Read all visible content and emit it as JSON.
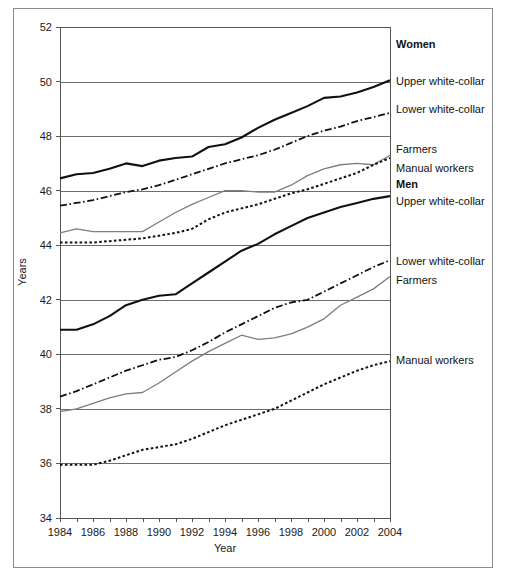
{
  "figure": {
    "border_color": "#8b8b8b",
    "background": "#ffffff"
  },
  "axes": {
    "x_title": "Year",
    "y_title": "Years",
    "y_ticks": [
      "34",
      "36",
      "38",
      "40",
      "42",
      "44",
      "46",
      "48",
      "50",
      "52"
    ],
    "x_ticks": [
      "1984",
      "1986",
      "1988",
      "1990",
      "1992",
      "1994",
      "1996",
      "1998",
      "2000",
      "2002",
      "2004"
    ]
  },
  "labels": {
    "women_group": "Women",
    "men_group": "Men",
    "women_upper": "Upper white-collar",
    "women_lower": "Lower white-collar",
    "women_farmers": "Farmers",
    "women_manual": "Manual workers",
    "men_upper": "Upper white-collar",
    "men_lower": "Lower white-collar",
    "men_farmers": "Farmers",
    "men_manual": "Manual workers"
  },
  "chart_data": {
    "type": "line",
    "title": "",
    "subtitle": "",
    "xlabel": "Year",
    "ylabel": "Years",
    "xlim": [
      1984,
      2004
    ],
    "ylim": [
      34,
      52
    ],
    "grid": "horizontal",
    "legend_position": "right-inline",
    "x": [
      1984,
      1985,
      1986,
      1987,
      1988,
      1989,
      1990,
      1991,
      1992,
      1993,
      1994,
      1995,
      1996,
      1997,
      1998,
      1999,
      2000,
      2001,
      2002,
      2003,
      2004
    ],
    "series": [
      {
        "name": "Women Upper white-collar",
        "group": "Women",
        "style": "solid-black",
        "color": "#111111",
        "values": [
          46.45,
          46.6,
          46.65,
          46.8,
          47.0,
          46.9,
          47.1,
          47.2,
          47.25,
          47.6,
          47.7,
          47.95,
          48.3,
          48.6,
          48.85,
          49.1,
          49.4,
          49.45,
          49.6,
          49.8,
          50.05
        ]
      },
      {
        "name": "Women Lower white-collar",
        "group": "Women",
        "style": "dash-dot",
        "color": "#111111",
        "values": [
          45.45,
          45.55,
          45.65,
          45.8,
          45.95,
          46.05,
          46.2,
          46.4,
          46.6,
          46.8,
          47.0,
          47.15,
          47.3,
          47.5,
          47.75,
          48.0,
          48.2,
          48.35,
          48.55,
          48.7,
          48.85
        ]
      },
      {
        "name": "Women Farmers",
        "group": "Women",
        "style": "gray-solid",
        "color": "#7d7d7d",
        "values": [
          44.45,
          44.6,
          44.5,
          44.5,
          44.5,
          44.5,
          44.85,
          45.2,
          45.5,
          45.75,
          46.0,
          46.0,
          45.95,
          45.95,
          46.2,
          46.55,
          46.8,
          46.95,
          47.0,
          46.95,
          47.3
        ]
      },
      {
        "name": "Women Manual workers",
        "group": "Women",
        "style": "dotted",
        "color": "#111111",
        "values": [
          44.1,
          44.1,
          44.1,
          44.15,
          44.2,
          44.25,
          44.35,
          44.45,
          44.6,
          44.95,
          45.2,
          45.35,
          45.5,
          45.7,
          45.9,
          46.05,
          46.25,
          46.45,
          46.65,
          46.95,
          47.2
        ]
      },
      {
        "name": "Men Upper white-collar",
        "group": "Men",
        "style": "solid-black",
        "color": "#111111",
        "values": [
          40.9,
          40.9,
          41.1,
          41.4,
          41.8,
          42.0,
          42.15,
          42.2,
          42.6,
          43.0,
          43.4,
          43.8,
          44.05,
          44.4,
          44.7,
          45.0,
          45.2,
          45.4,
          45.55,
          45.7,
          45.8
        ]
      },
      {
        "name": "Men Lower white-collar",
        "group": "Men",
        "style": "dash-dot",
        "color": "#111111",
        "values": [
          38.45,
          38.65,
          38.9,
          39.15,
          39.4,
          39.6,
          39.8,
          39.9,
          40.15,
          40.45,
          40.8,
          41.1,
          41.4,
          41.7,
          41.9,
          42.0,
          42.3,
          42.6,
          42.9,
          43.2,
          43.45
        ]
      },
      {
        "name": "Men Farmers",
        "group": "Men",
        "style": "gray-solid",
        "color": "#7d7d7d",
        "values": [
          37.9,
          38.0,
          38.2,
          38.4,
          38.55,
          38.6,
          38.95,
          39.35,
          39.75,
          40.1,
          40.4,
          40.7,
          40.55,
          40.6,
          40.75,
          41.0,
          41.3,
          41.8,
          42.1,
          42.4,
          42.85
        ]
      },
      {
        "name": "Men Manual workers",
        "group": "Men",
        "style": "dotted",
        "color": "#111111",
        "values": [
          35.95,
          35.95,
          35.95,
          36.1,
          36.3,
          36.5,
          36.6,
          36.7,
          36.9,
          37.15,
          37.4,
          37.6,
          37.8,
          38.0,
          38.3,
          38.6,
          38.9,
          39.15,
          39.4,
          39.6,
          39.75
        ]
      }
    ]
  }
}
